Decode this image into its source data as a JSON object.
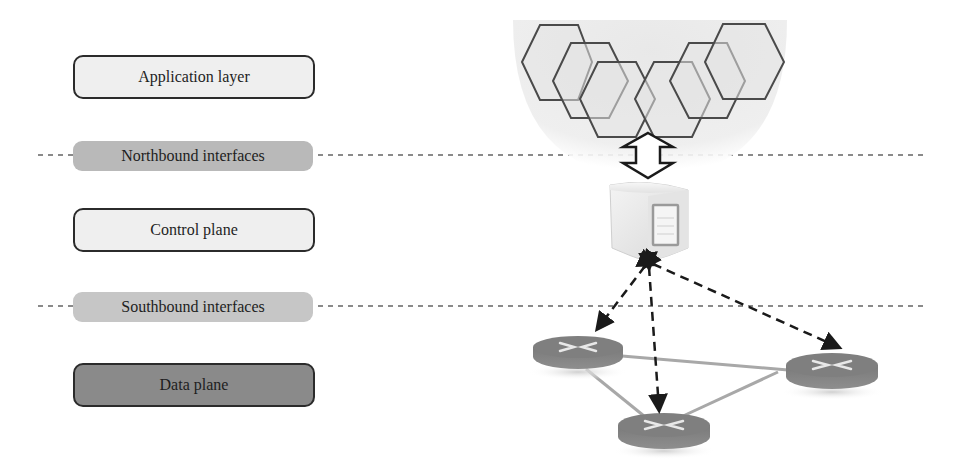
{
  "layers": {
    "application": {
      "label": "Application layer",
      "fill": "#efefef"
    },
    "northbound": {
      "label": "Northbound interfaces",
      "fill": "#b9b9b9"
    },
    "control": {
      "label": "Control plane",
      "fill": "#efefef"
    },
    "southbound": {
      "label": "Southbound interfaces",
      "fill": "#c6c6c6"
    },
    "data": {
      "label": "Data plane",
      "fill": "#8a8a8a"
    }
  },
  "illustration": {
    "applications": {
      "icon": "hexagon-cluster-icon",
      "count": 6
    },
    "controller": {
      "icon": "server-icon"
    },
    "northbound_link": {
      "icon": "double-arrow-icon"
    },
    "switches": {
      "icon": "router-icon",
      "count": 3
    },
    "southbound_links": {
      "icon": "dashed-arrow-icon",
      "count": 3
    }
  }
}
